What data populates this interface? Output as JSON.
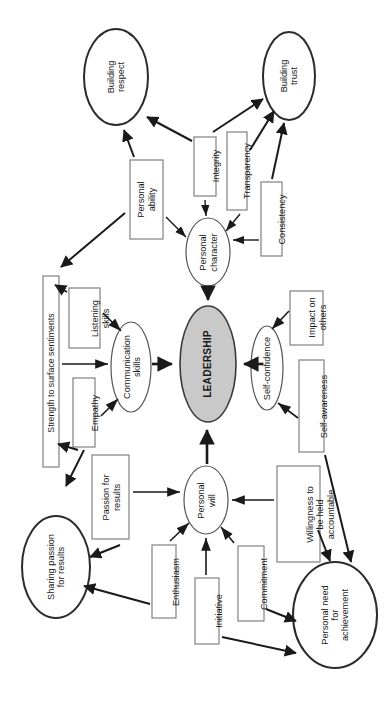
{
  "diagram": {
    "title": "LEADERSHIP",
    "orientation": "rotated-90-ccw",
    "colors": {
      "core_fill": "#c9c9c9",
      "core_stroke": "#3a3a3a",
      "ellipse_stroke": "#2b2b2b",
      "box_stroke": "#808080",
      "arrow": "#1a1a1a",
      "text": "#1a1a1a",
      "background": "#ffffff"
    },
    "core": {
      "label": "LEADERSHIP"
    },
    "outcome_nodes": [
      {
        "id": "building-respect",
        "label": "Building\nrespect"
      },
      {
        "id": "building-trust",
        "label": "Building\ntrust"
      },
      {
        "id": "sharing-passion-for-results",
        "label": "Sharing passion\nfor results"
      },
      {
        "id": "personal-need-for-achievement",
        "label": "Personal need\nfor\nachievement"
      }
    ],
    "pillar_nodes": [
      {
        "id": "personal-character",
        "label": "Personal\ncharacter"
      },
      {
        "id": "communication-skills",
        "label": "Communication\nskills"
      },
      {
        "id": "self-confidence",
        "label": "Self-confidence"
      },
      {
        "id": "personal-will",
        "label": "Personal\nwill"
      }
    ],
    "driver_boxes": [
      {
        "id": "personal-ability",
        "label": "Personal\nability"
      },
      {
        "id": "integrity",
        "label": "Integrity"
      },
      {
        "id": "transparency",
        "label": "Transparency"
      },
      {
        "id": "consistency",
        "label": "Consistency"
      },
      {
        "id": "strength-to-surface-sentiments",
        "label": "Strength to surface sentiments"
      },
      {
        "id": "listening-skills",
        "label": "Listening\nskills"
      },
      {
        "id": "empathy",
        "label": "Empathy"
      },
      {
        "id": "impact-on-others",
        "label": "Impact on\nothers"
      },
      {
        "id": "self-awareness",
        "label": "Self-awareness"
      },
      {
        "id": "passion-for-results",
        "label": "Passion for\nresults"
      },
      {
        "id": "enthusiasm",
        "label": "Enthusiasm"
      },
      {
        "id": "initiative",
        "label": "Initiative"
      },
      {
        "id": "commitment",
        "label": "Commitment"
      },
      {
        "id": "willingness-to-be-held-accountable",
        "label": "Willingness to\nbe held\naccountable"
      }
    ],
    "connections": [
      {
        "from": "personal-ability",
        "to": "building-respect"
      },
      {
        "from": "integrity",
        "to": "building-respect"
      },
      {
        "from": "integrity",
        "to": "building-trust"
      },
      {
        "from": "transparency",
        "to": "building-trust"
      },
      {
        "from": "consistency",
        "to": "building-trust"
      },
      {
        "from": "personal-ability",
        "to": "personal-character"
      },
      {
        "from": "integrity",
        "to": "personal-character"
      },
      {
        "from": "transparency",
        "to": "personal-character"
      },
      {
        "from": "consistency",
        "to": "personal-character"
      },
      {
        "from": "personal-character",
        "to": "LEADERSHIP"
      },
      {
        "from": "personal-ability",
        "to": "strength-to-surface-sentiments"
      },
      {
        "from": "listening-skills",
        "to": "strength-to-surface-sentiments"
      },
      {
        "from": "listening-skills",
        "to": "communication-skills"
      },
      {
        "from": "empathy",
        "to": "communication-skills"
      },
      {
        "from": "strength-to-surface-sentiments",
        "to": "communication-skills"
      },
      {
        "from": "communication-skills",
        "to": "LEADERSHIP"
      },
      {
        "from": "impact-on-others",
        "to": "self-confidence"
      },
      {
        "from": "self-awareness",
        "to": "self-confidence"
      },
      {
        "from": "self-confidence",
        "to": "LEADERSHIP"
      },
      {
        "from": "passion-for-results",
        "to": "personal-will"
      },
      {
        "from": "enthusiasm",
        "to": "personal-will"
      },
      {
        "from": "initiative",
        "to": "personal-will"
      },
      {
        "from": "commitment",
        "to": "personal-will"
      },
      {
        "from": "willingness-to-be-held-accountable",
        "to": "personal-will"
      },
      {
        "from": "personal-will",
        "to": "LEADERSHIP"
      },
      {
        "from": "passion-for-results",
        "to": "sharing-passion-for-results"
      },
      {
        "from": "enthusiasm",
        "to": "sharing-passion-for-results"
      },
      {
        "from": "empathy",
        "to": "sharing-passion-for-results"
      },
      {
        "from": "initiative",
        "to": "personal-need-for-achievement"
      },
      {
        "from": "commitment",
        "to": "personal-need-for-achievement"
      },
      {
        "from": "willingness-to-be-held-accountable",
        "to": "personal-need-for-achievement"
      },
      {
        "from": "self-awareness",
        "to": "personal-need-for-achievement"
      }
    ]
  }
}
